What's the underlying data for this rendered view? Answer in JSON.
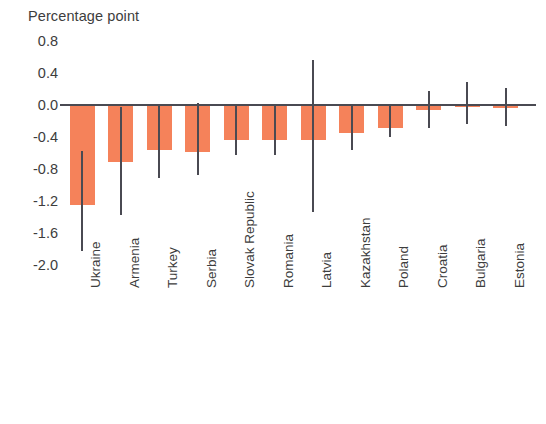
{
  "chart_data": {
    "type": "bar",
    "title": "Percentage point",
    "xlabel": "",
    "ylabel": "Percentage point",
    "ylim": [
      -2.0,
      0.8
    ],
    "yticks": [
      0.8,
      0.4,
      0.0,
      -0.4,
      -0.8,
      -1.2,
      -1.6,
      -2.0
    ],
    "ytick_labels": [
      "0.8",
      "0.4",
      "0.0",
      "-0.4",
      "-0.8",
      "-1.2",
      "-1.6",
      "-2.0"
    ],
    "grid": false,
    "legend": "none",
    "bar_color": "#f4794d",
    "error_bar_color": "#4a4a52",
    "axis_color": "#4a4a52",
    "categories": [
      "Ukraine",
      "Armenia",
      "Turkey",
      "Serbia",
      "Slovak Republic",
      "Romania",
      "Latvia",
      "Kazakhstan",
      "Poland",
      "Croatia",
      "Bulgaria",
      "Estonia"
    ],
    "values": [
      -1.25,
      -0.71,
      -0.56,
      -0.59,
      -0.44,
      -0.44,
      -0.44,
      -0.35,
      -0.29,
      -0.06,
      -0.03,
      -0.04
    ],
    "error_low": [
      -1.82,
      -1.37,
      -0.91,
      -0.87,
      -0.62,
      -0.62,
      -1.34,
      -0.56,
      -0.4,
      -0.29,
      -0.24,
      -0.26
    ],
    "error_high": [
      -0.57,
      -0.02,
      0.0,
      0.02,
      0.0,
      0.0,
      0.56,
      0.0,
      0.0,
      0.17,
      0.29,
      0.21
    ]
  }
}
